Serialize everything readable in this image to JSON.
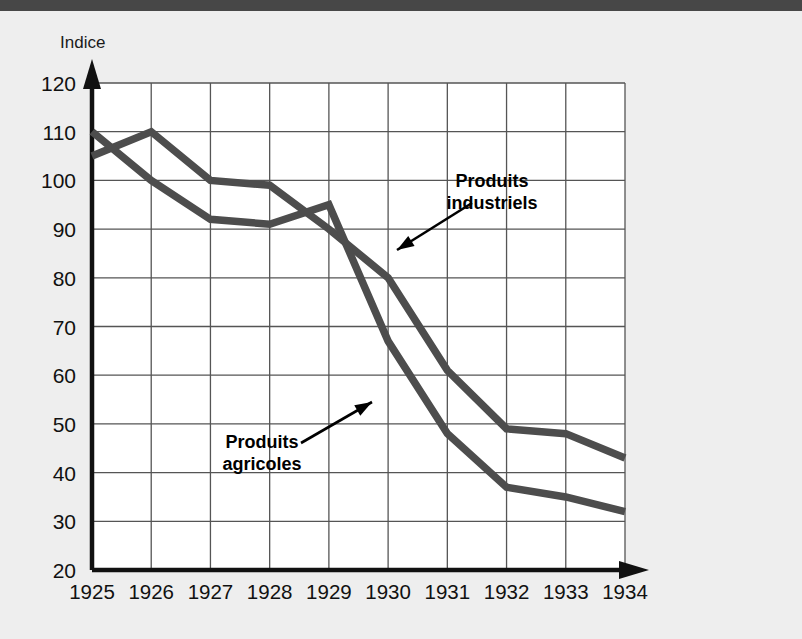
{
  "page": {
    "background_color": "#eeeeee",
    "top_bar_color": "#474747"
  },
  "chart_data": {
    "type": "line",
    "title": "",
    "xlabel": "",
    "ylabel": "Indice",
    "categories": [
      "1925",
      "1926",
      "1927",
      "1928",
      "1929",
      "1930",
      "1931",
      "1932",
      "1933",
      "1934"
    ],
    "x": [
      1925,
      1926,
      1927,
      1928,
      1929,
      1930,
      1931,
      1932,
      1933,
      1934
    ],
    "xlim": [
      1925,
      1934
    ],
    "ylim": [
      20,
      120
    ],
    "yticks": [
      120,
      110,
      100,
      90,
      80,
      70,
      60,
      50,
      40,
      30,
      20
    ],
    "xticks": [
      "1925",
      "1926",
      "1927",
      "1928",
      "1929",
      "1930",
      "1931",
      "1932",
      "1933",
      "1934"
    ],
    "grid": true,
    "legend": "annotations",
    "line_color": "#4d4d4d",
    "grid_color": "#555555",
    "axis_color": "#111111",
    "plot_background": "#ffffff",
    "series": [
      {
        "name": "Produits industriels",
        "values": [
          105,
          110,
          100,
          99,
          90,
          80,
          61,
          49,
          48,
          43
        ]
      },
      {
        "name": "Produits agricoles",
        "values": [
          110,
          100,
          92,
          91,
          95,
          67,
          48,
          37,
          35,
          32
        ]
      }
    ],
    "annotations": [
      {
        "label_line1": "Produits",
        "label_line2": "industriels",
        "text_x": 492,
        "text_y": 176,
        "arrow_from_x": 472,
        "arrow_from_y": 192,
        "arrow_to_x": 397,
        "arrow_to_y": 239
      },
      {
        "label_line1": "Produits",
        "label_line2": "agricoles",
        "text_x": 262,
        "text_y": 437,
        "arrow_from_x": 301,
        "arrow_from_y": 432,
        "arrow_to_x": 372,
        "arrow_to_y": 391
      }
    ]
  }
}
